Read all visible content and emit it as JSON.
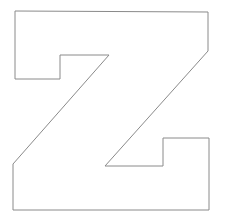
{
  "figure": {
    "letter": "Z",
    "stroke_color": "#8a8a8a",
    "fill_color": "#ffffff",
    "background": "#ffffff",
    "outline_points": "15,11 208,12 208,51 109,55 60,55 60,79 15,79"
  }
}
